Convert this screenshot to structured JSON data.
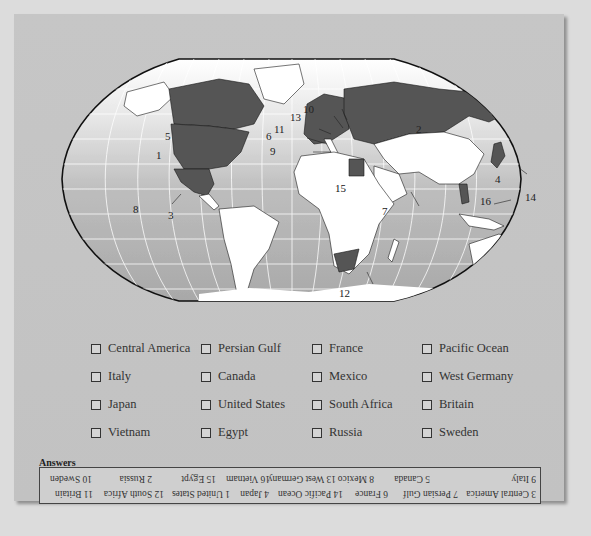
{
  "map": {
    "title": "World map",
    "labels": [
      {
        "n": "1",
        "x": 150,
        "y": 115
      },
      {
        "n": "2",
        "x": 402,
        "y": 86
      },
      {
        "n": "3",
        "x": 152,
        "y": 167
      },
      {
        "n": "4",
        "x": 479,
        "y": 132
      },
      {
        "n": "5",
        "x": 150,
        "y": 89
      },
      {
        "n": "6",
        "x": 252,
        "y": 92
      },
      {
        "n": "7",
        "x": 369,
        "y": 164
      },
      {
        "n": "8",
        "x": 119,
        "y": 161
      },
      {
        "n": "9",
        "x": 257,
        "y": 106
      },
      {
        "n": "10",
        "x": 287,
        "y": 62
      },
      {
        "n": "11",
        "x": 261,
        "y": 82
      },
      {
        "n": "12",
        "x": 322,
        "y": 250
      },
      {
        "n": "13",
        "x": 276,
        "y": 70
      },
      {
        "n": "14",
        "x": 511,
        "y": 152
      },
      {
        "n": "15",
        "x": 321,
        "y": 143
      },
      {
        "n": "16",
        "x": 465,
        "y": 155
      }
    ],
    "colors": {
      "ocean": "#b8b8b8",
      "land": "#ffffff",
      "highlight": "#555555",
      "border": "#1a1a1a"
    }
  },
  "quiz": {
    "items": [
      "Central America",
      "Persian Gulf",
      "France",
      "Pacific Ocean",
      "Italy",
      "Canada",
      "Mexico",
      "West Germany",
      "Japan",
      "United States",
      "South Africa",
      "Britain",
      "Vietnam",
      "Egypt",
      "Russia",
      "Sweden"
    ]
  },
  "answers": {
    "title": "Answers",
    "row1": [
      "3 Central America",
      "7 Persian Gulf",
      "6 France",
      "14 Pacific Ocean",
      "4 Japan",
      "1 United States",
      "12 South Africa",
      "11 Britain"
    ],
    "row2": [
      "9 Italy",
      "5 Canada",
      "8 Mexico",
      "13 West Germany",
      "16 Vietnam",
      "15 Egypt",
      "2 Russia",
      "10 Sweden"
    ]
  }
}
